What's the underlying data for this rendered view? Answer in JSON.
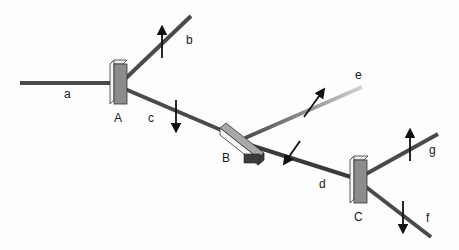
{
  "diagram": {
    "type": "optical-beam-splitter-setup",
    "colors": {
      "beam": "#4a4a4a",
      "beam_light": "#c8c8c8",
      "mirror_face": "#8c8c8c",
      "mirror_side": "#f2f2f2",
      "mirror_dark": "#3c3c3c",
      "arrow": "#111111"
    },
    "components": [
      {
        "id": "A",
        "label": "A"
      },
      {
        "id": "B",
        "label": "B"
      },
      {
        "id": "C",
        "label": "C"
      }
    ],
    "beams": [
      {
        "id": "a",
        "label": "a",
        "polarization": "none"
      },
      {
        "id": "b",
        "label": "b",
        "polarization": "up"
      },
      {
        "id": "c",
        "label": "c",
        "polarization": "down"
      },
      {
        "id": "d",
        "label": "d",
        "polarization": "diagonal"
      },
      {
        "id": "e",
        "label": "e",
        "polarization": "diagonal"
      },
      {
        "id": "f",
        "label": "f",
        "polarization": "down"
      },
      {
        "id": "g",
        "label": "g",
        "polarization": "up"
      }
    ]
  }
}
